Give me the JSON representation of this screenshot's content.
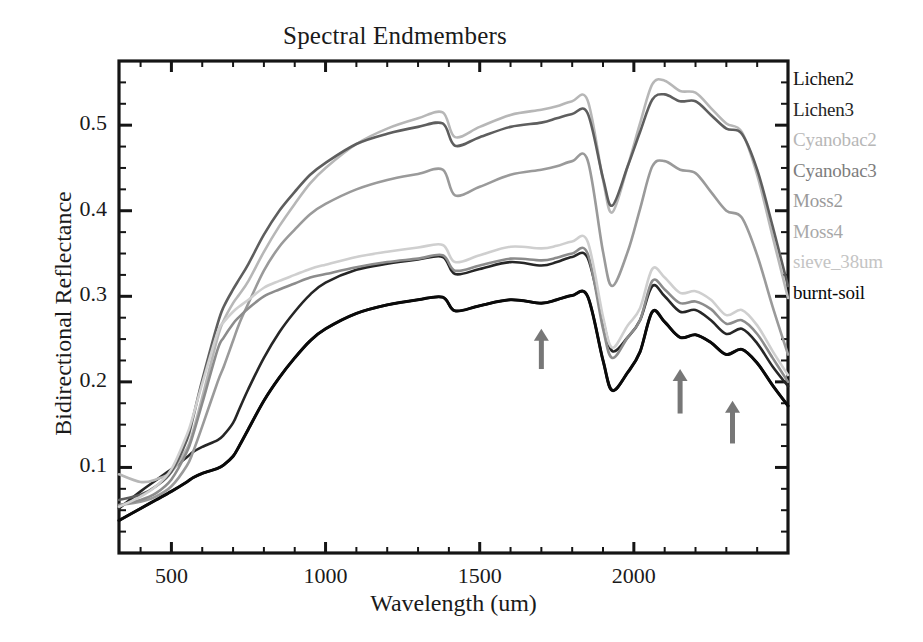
{
  "chart_data": {
    "type": "line",
    "title": "Spectral Endmembers",
    "xlabel": "Wavelength (um)",
    "ylabel": "Bidirectional Reflectance",
    "xlim": [
      330,
      2500
    ],
    "ylim": [
      0.0,
      0.575
    ],
    "xticks": [
      500,
      1000,
      1500,
      2000
    ],
    "xtick_labels": [
      "500",
      "1000",
      "1500",
      "2000"
    ],
    "xminor_step": 100,
    "yticks": [
      0.1,
      0.2,
      0.3,
      0.4,
      0.5
    ],
    "ytick_labels": [
      "0.1",
      "0.2",
      "0.3",
      "0.4",
      "0.5"
    ],
    "yminor_step": 0.025,
    "grid": false,
    "legend_position": "right-outside",
    "x": [
      330,
      400,
      450,
      500,
      550,
      570,
      600,
      650,
      670,
      700,
      720,
      750,
      800,
      850,
      900,
      950,
      1000,
      1100,
      1200,
      1300,
      1380,
      1420,
      1500,
      1600,
      1700,
      1750,
      1800,
      1850,
      1900,
      1930,
      1980,
      2020,
      2060,
      2100,
      2150,
      2200,
      2250,
      2300,
      2350,
      2400,
      2450,
      2500
    ],
    "series": [
      {
        "name": "Lichen2",
        "color": "#141414",
        "width": 2.6,
        "values": [
          0.038,
          0.052,
          0.062,
          0.072,
          0.083,
          0.088,
          0.093,
          0.099,
          0.103,
          0.113,
          0.125,
          0.145,
          0.178,
          0.205,
          0.228,
          0.248,
          0.262,
          0.28,
          0.29,
          0.296,
          0.299,
          0.283,
          0.289,
          0.296,
          0.292,
          0.296,
          0.301,
          0.3,
          0.225,
          0.19,
          0.211,
          0.235,
          0.282,
          0.27,
          0.252,
          0.255,
          0.246,
          0.232,
          0.238,
          0.222,
          0.196,
          0.172
        ]
      },
      {
        "name": "Lichen3",
        "color": "#262626",
        "width": 2.6,
        "values": [
          0.052,
          0.072,
          0.085,
          0.098,
          0.112,
          0.118,
          0.124,
          0.132,
          0.138,
          0.152,
          0.168,
          0.192,
          0.228,
          0.258,
          0.282,
          0.302,
          0.316,
          0.331,
          0.338,
          0.343,
          0.346,
          0.326,
          0.332,
          0.34,
          0.336,
          0.34,
          0.346,
          0.345,
          0.272,
          0.236,
          0.252,
          0.272,
          0.312,
          0.3,
          0.282,
          0.284,
          0.272,
          0.256,
          0.262,
          0.245,
          0.218,
          0.195
        ]
      },
      {
        "name": "Cyanobac2",
        "color": "#b7b7b7",
        "width": 2.6,
        "values": [
          0.092,
          0.083,
          0.086,
          0.095,
          0.122,
          0.142,
          0.182,
          0.252,
          0.272,
          0.292,
          0.302,
          0.318,
          0.352,
          0.382,
          0.408,
          0.432,
          0.45,
          0.478,
          0.496,
          0.508,
          0.515,
          0.486,
          0.498,
          0.512,
          0.518,
          0.522,
          0.528,
          0.529,
          0.436,
          0.398,
          0.452,
          0.502,
          0.548,
          0.552,
          0.54,
          0.538,
          0.52,
          0.502,
          0.492,
          0.442,
          0.37,
          0.298
        ]
      },
      {
        "name": "Cyanobac3",
        "color": "#5e5e5e",
        "width": 2.6,
        "values": [
          0.062,
          0.068,
          0.078,
          0.095,
          0.132,
          0.158,
          0.202,
          0.268,
          0.288,
          0.308,
          0.32,
          0.338,
          0.372,
          0.4,
          0.422,
          0.442,
          0.456,
          0.478,
          0.49,
          0.498,
          0.502,
          0.476,
          0.486,
          0.498,
          0.503,
          0.508,
          0.513,
          0.514,
          0.438,
          0.406,
          0.452,
          0.492,
          0.53,
          0.536,
          0.528,
          0.528,
          0.512,
          0.496,
          0.49,
          0.448,
          0.382,
          0.312
        ]
      },
      {
        "name": "Moss2",
        "color": "#9a9a9a",
        "width": 2.6,
        "values": [
          0.056,
          0.06,
          0.066,
          0.078,
          0.102,
          0.118,
          0.148,
          0.2,
          0.218,
          0.248,
          0.268,
          0.292,
          0.33,
          0.358,
          0.378,
          0.396,
          0.408,
          0.425,
          0.436,
          0.443,
          0.448,
          0.418,
          0.428,
          0.442,
          0.448,
          0.452,
          0.458,
          0.459,
          0.352,
          0.312,
          0.352,
          0.402,
          0.452,
          0.458,
          0.448,
          0.444,
          0.422,
          0.4,
          0.392,
          0.348,
          0.288,
          0.232
        ]
      },
      {
        "name": "Moss4",
        "color": "#8c8c8c",
        "width": 2.6,
        "values": [
          0.056,
          0.062,
          0.07,
          0.086,
          0.118,
          0.138,
          0.175,
          0.238,
          0.252,
          0.268,
          0.276,
          0.286,
          0.3,
          0.308,
          0.315,
          0.322,
          0.326,
          0.334,
          0.34,
          0.344,
          0.348,
          0.33,
          0.336,
          0.344,
          0.342,
          0.345,
          0.35,
          0.35,
          0.262,
          0.228,
          0.252,
          0.272,
          0.318,
          0.308,
          0.292,
          0.294,
          0.285,
          0.268,
          0.272,
          0.256,
          0.228,
          0.2
        ]
      },
      {
        "name": "sieve_38um",
        "color": "#cfcfcf",
        "width": 2.6,
        "values": [
          0.054,
          0.066,
          0.078,
          0.098,
          0.138,
          0.16,
          0.198,
          0.258,
          0.27,
          0.282,
          0.288,
          0.296,
          0.31,
          0.318,
          0.325,
          0.332,
          0.337,
          0.346,
          0.352,
          0.357,
          0.36,
          0.34,
          0.348,
          0.358,
          0.356,
          0.359,
          0.364,
          0.364,
          0.276,
          0.24,
          0.266,
          0.286,
          0.332,
          0.322,
          0.304,
          0.306,
          0.296,
          0.278,
          0.284,
          0.266,
          0.236,
          0.208
        ]
      },
      {
        "name": "burnt-soil",
        "color": "#0a0a0a",
        "width": 3.0,
        "values": [
          0.038,
          0.052,
          0.062,
          0.072,
          0.083,
          0.088,
          0.093,
          0.099,
          0.103,
          0.113,
          0.125,
          0.145,
          0.178,
          0.205,
          0.228,
          0.248,
          0.262,
          0.28,
          0.29,
          0.296,
          0.299,
          0.283,
          0.289,
          0.296,
          0.292,
          0.296,
          0.301,
          0.3,
          0.225,
          0.19,
          0.211,
          0.235,
          0.282,
          0.27,
          0.252,
          0.255,
          0.246,
          0.232,
          0.238,
          0.222,
          0.196,
          0.172
        ]
      }
    ],
    "annotations": [
      {
        "name": "arrow-1700nm",
        "symbol": "up-arrow",
        "x": 1700,
        "y_tip": 0.262,
        "y_tail": 0.215,
        "color": "#777777"
      },
      {
        "name": "arrow-2150nm",
        "symbol": "up-arrow",
        "x": 2150,
        "y_tip": 0.215,
        "y_tail": 0.163,
        "color": "#777777"
      },
      {
        "name": "arrow-2320nm",
        "symbol": "up-arrow",
        "x": 2320,
        "y_tip": 0.178,
        "y_tail": 0.128,
        "color": "#777777"
      }
    ]
  },
  "legend": {
    "entries": [
      {
        "label": "Lichen2",
        "color": "#141414"
      },
      {
        "label": "Lichen3",
        "color": "#262626"
      },
      {
        "label": "Cyanobac2",
        "color": "#b7b7b7"
      },
      {
        "label": "Cyanobac3",
        "color": "#7d7d7d"
      },
      {
        "label": "Moss2",
        "color": "#9a9a9a"
      },
      {
        "label": "Moss4",
        "color": "#a8a8a8"
      },
      {
        "label": "sieve_38um",
        "color": "#c4c4c4"
      },
      {
        "label": "burnt-soil",
        "color": "#0a0a0a"
      }
    ]
  }
}
